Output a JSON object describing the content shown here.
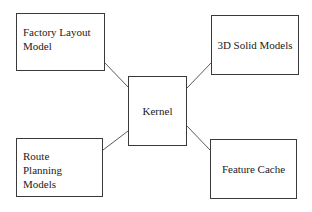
{
  "diagram": {
    "type": "hub-and-spoke block diagram",
    "nodes": {
      "kernel": {
        "label": "Kernel"
      },
      "factory_layout": {
        "label": "Factory Layout Model"
      },
      "solid_models": {
        "label": "3D Solid Models"
      },
      "route_planning": {
        "label": "Route Planning Models"
      },
      "feature_cache": {
        "label": "Feature Cache"
      }
    },
    "edges": [
      {
        "from": "factory_layout",
        "to": "kernel"
      },
      {
        "from": "solid_models",
        "to": "kernel"
      },
      {
        "from": "route_planning",
        "to": "kernel"
      },
      {
        "from": "feature_cache",
        "to": "kernel"
      }
    ],
    "colors": {
      "border": "#3a3a3a",
      "connector": "#5a5a5a",
      "text": "#1a1a1a",
      "background": "#ffffff"
    }
  }
}
